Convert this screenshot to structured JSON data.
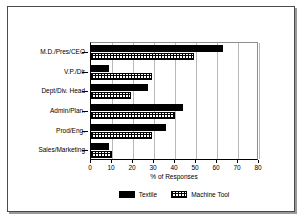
{
  "chart_data": {
    "type": "bar",
    "orientation": "horizontal",
    "title": "",
    "xlabel": "% of Responses",
    "ylabel": "",
    "xlim": [
      0,
      80
    ],
    "xticks": [
      0,
      10,
      20,
      30,
      40,
      50,
      60,
      70,
      80
    ],
    "grid": true,
    "legend_position": "bottom",
    "categories": [
      "M.D./Pres/CEO",
      "V.P./Dir",
      "Dept/Div. Head",
      "Admin/Plan.",
      "Prod/Eng.",
      "Sales/Marketing"
    ],
    "series": [
      {
        "name": "Textile",
        "color": "#000000",
        "pattern": "solid",
        "values": [
          63,
          8.5,
          27,
          44,
          35.5,
          8.5
        ]
      },
      {
        "name": "Machine Tool",
        "color": "#000000",
        "pattern": "cross-hatch",
        "values": [
          49,
          29,
          19,
          40,
          29,
          10
        ]
      }
    ]
  },
  "legend": {
    "entries": [
      {
        "label": "Textile"
      },
      {
        "label": "Machine Tool"
      }
    ]
  }
}
